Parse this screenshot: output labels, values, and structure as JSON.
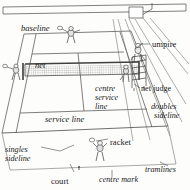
{
  "figure": {
    "subject": "court",
    "style": "line drawing, perspective view",
    "colors": {
      "ink": "#2b2b2b",
      "line": "#555555",
      "background": "#fdfdfc",
      "net_mesh": "#8a8a8a",
      "label_text": "#1a1a1a"
    }
  },
  "labels": [
    {
      "id": "baseline",
      "text": "baseline",
      "style": "italic",
      "x": 21,
      "y": 24
    },
    {
      "id": "net",
      "text": "net",
      "style": "italic",
      "x": 35,
      "y": 61
    },
    {
      "id": "umpire",
      "text": "umpire",
      "style": "upright",
      "x": 152,
      "y": 40
    },
    {
      "id": "net-judge",
      "text": "net judge",
      "style": "upright",
      "x": 141,
      "y": 85
    },
    {
      "id": "doubles",
      "text": "doubles",
      "style": "italic",
      "x": 151,
      "y": 103
    },
    {
      "id": "doubles-2",
      "text": "sideline",
      "style": "italic",
      "x": 154,
      "y": 112
    },
    {
      "id": "centre",
      "text": "centre",
      "style": "italic",
      "x": 95,
      "y": 85
    },
    {
      "id": "centre-2",
      "text": "service",
      "style": "italic",
      "x": 95,
      "y": 94
    },
    {
      "id": "centre-3",
      "text": "line",
      "style": "italic",
      "x": 95,
      "y": 103
    },
    {
      "id": "service-line",
      "text": "service line",
      "style": "italic",
      "x": 45,
      "y": 115
    },
    {
      "id": "singles",
      "text": "singles",
      "style": "italic",
      "x": 5,
      "y": 146
    },
    {
      "id": "singles-2",
      "text": "sideline",
      "style": "italic",
      "x": 5,
      "y": 155
    },
    {
      "id": "racket",
      "text": "racket",
      "style": "upright",
      "x": 110,
      "y": 138
    },
    {
      "id": "tramlines",
      "text": "tramlines",
      "style": "italic",
      "x": 145,
      "y": 166
    },
    {
      "id": "court",
      "text": "court",
      "style": "upright",
      "x": 51,
      "y": 177
    },
    {
      "id": "centre-mark",
      "text": "centre mark",
      "style": "italic",
      "x": 99,
      "y": 176
    }
  ],
  "elements": [
    {
      "name": "back-wall",
      "kind": "boundary"
    },
    {
      "name": "court-outline",
      "kind": "court"
    },
    {
      "name": "net",
      "kind": "net"
    },
    {
      "name": "net-post-left",
      "kind": "post"
    },
    {
      "name": "net-post-right",
      "kind": "post"
    },
    {
      "name": "umpire-chair",
      "kind": "furniture"
    },
    {
      "name": "umpire-figure",
      "kind": "person"
    },
    {
      "name": "net-judge-figure",
      "kind": "person"
    },
    {
      "name": "player-far",
      "kind": "person"
    },
    {
      "name": "player-near",
      "kind": "person"
    },
    {
      "name": "line-judge",
      "kind": "person"
    },
    {
      "name": "centre-mark",
      "kind": "court-marking"
    },
    {
      "name": "tramlines",
      "kind": "court-marking"
    }
  ]
}
